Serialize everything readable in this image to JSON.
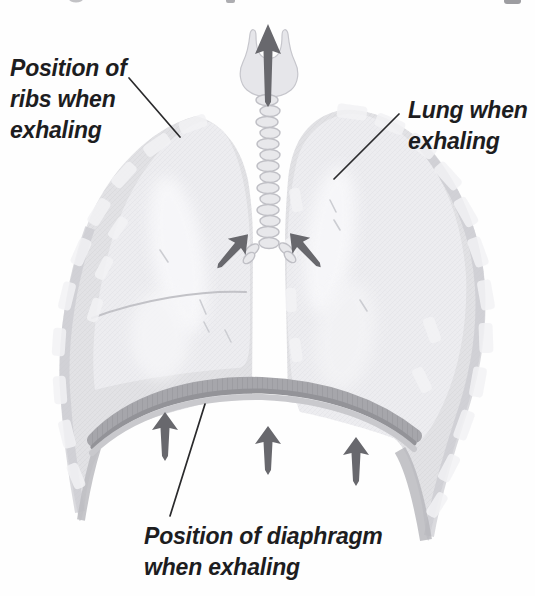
{
  "figure": {
    "labels": {
      "ribs": "Position of\nribs when\nexhaling",
      "lung": "Lung when\nexhaling",
      "diaphragm": "Position of diaphragm\nwhen exhaling"
    },
    "arrows": {
      "trachea_up": "air-out-up-arrow",
      "ribs_inward_left": "ribs-move-in-left-arrow",
      "ribs_inward_right": "ribs-move-in-right-arrow",
      "diaphragm_up": [
        "diaphragm-up-arrow-left",
        "diaphragm-up-arrow-middle",
        "diaphragm-up-arrow-right"
      ]
    },
    "colors": {
      "bg": "#fefefe",
      "text": "#1d1d1f",
      "leader": "#2a2a2c",
      "arrow": "#68686d",
      "ribcage": "#e2e2e5",
      "lung": "#ededf0",
      "patch": "#f2f2f5",
      "diaphragm": "#a6a6ab",
      "diaphragm_dark": "#939398",
      "diaphragm_light": "#c9c9cd",
      "ring_fill": "#e8e8eb",
      "ring_stroke": "#bfbfc5",
      "hatch": "#c4c4c9"
    }
  }
}
